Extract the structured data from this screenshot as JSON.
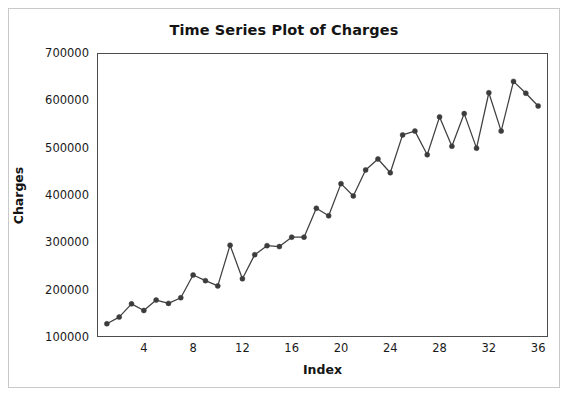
{
  "figure": {
    "title": "Time Series Plot of Charges",
    "background_color": "#ffffff",
    "border_color": "#c9c9c9"
  },
  "chart_data": {
    "type": "line",
    "title": "Time Series Plot of Charges",
    "xlabel": "Index",
    "ylabel": "Charges",
    "xlim": [
      0.2,
      36.8
    ],
    "ylim": [
      100000,
      700000
    ],
    "grid": false,
    "legend": null,
    "marker": "filled-circle",
    "line_color": "#3f3f3f",
    "marker_color": "#3c3c3c",
    "x_ticks": [
      4,
      8,
      12,
      16,
      20,
      24,
      28,
      32,
      36
    ],
    "x_tick_labels": [
      "4",
      "8",
      "12",
      "16",
      "20",
      "24",
      "28",
      "32",
      "36"
    ],
    "y_ticks": [
      100000,
      200000,
      300000,
      400000,
      500000,
      600000,
      700000
    ],
    "y_tick_labels": [
      "100000",
      "200000",
      "300000",
      "400000",
      "500000",
      "600000",
      "700000"
    ],
    "x": [
      1,
      2,
      3,
      4,
      5,
      6,
      7,
      8,
      9,
      10,
      11,
      12,
      13,
      14,
      15,
      16,
      17,
      18,
      19,
      20,
      21,
      22,
      23,
      24,
      25,
      26,
      27,
      28,
      29,
      30,
      31,
      32,
      33,
      34,
      35,
      36
    ],
    "values": [
      128000,
      142000,
      170000,
      156000,
      178000,
      171000,
      183000,
      231000,
      219000,
      208000,
      294000,
      223000,
      274000,
      293000,
      291000,
      311000,
      311000,
      372000,
      356000,
      424000,
      398000,
      453000,
      476000,
      447000,
      527000,
      535000,
      485000,
      565000,
      503000,
      572000,
      499000,
      616000,
      535000,
      640000,
      615000,
      588000
    ],
    "series": [
      {
        "name": "Charges",
        "values": [
          128000,
          142000,
          170000,
          156000,
          178000,
          171000,
          183000,
          231000,
          219000,
          208000,
          294000,
          223000,
          274000,
          293000,
          291000,
          311000,
          311000,
          372000,
          356000,
          424000,
          398000,
          453000,
          476000,
          447000,
          527000,
          535000,
          485000,
          565000,
          503000,
          572000,
          499000,
          616000,
          535000,
          640000,
          615000,
          588000
        ]
      }
    ]
  }
}
